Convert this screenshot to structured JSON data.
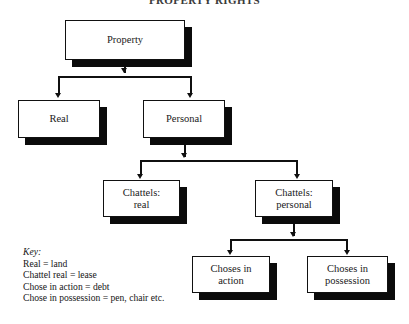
{
  "document": {
    "title": "PROPERTY RIGHTS"
  },
  "diagram": {
    "type": "hierarchy-tree",
    "nodes": {
      "property": "Property",
      "real": "Real",
      "personal": "Personal",
      "chattels_real_line1": "Chattels:",
      "chattels_real_line2": "real",
      "chattels_personal_line1": "Chattels:",
      "chattels_personal_line2": "personal",
      "choses_action_line1": "Choses in",
      "choses_action_line2": "action",
      "choses_possession_line1": "Choses in",
      "choses_possession_line2": "possession"
    },
    "edges": [
      {
        "from": "property",
        "to": "real"
      },
      {
        "from": "property",
        "to": "personal"
      },
      {
        "from": "personal",
        "to": "chattels_real"
      },
      {
        "from": "personal",
        "to": "chattels_personal"
      },
      {
        "from": "chattels_personal",
        "to": "choses_action"
      },
      {
        "from": "chattels_personal",
        "to": "choses_possession"
      }
    ]
  },
  "key": {
    "heading": "Key:",
    "entries": [
      "Real = land",
      "Chattel real = lease",
      "Chose in action = debt",
      "Chose in possession = pen, chair etc."
    ]
  },
  "colors": {
    "line": "#101010",
    "box_fill": "#ffffff",
    "box_border": "#111111",
    "shadow": "#0b0b0b",
    "text": "#1a1a1a",
    "background": "#ffffff"
  }
}
